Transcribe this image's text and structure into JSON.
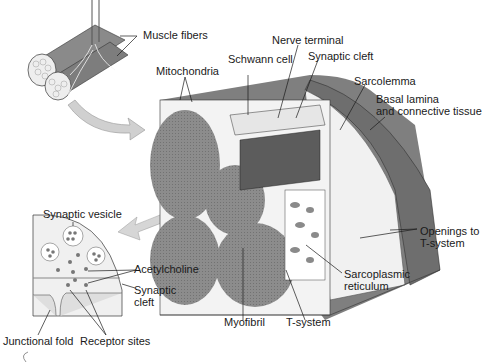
{
  "figure": {
    "colors": {
      "background": "#ffffff",
      "muscle_gray": "#8f8f8f",
      "dark_gray": "#6e6e6e",
      "light_gray": "#d9d9d9",
      "cytoplasm": "#f2f2f2",
      "arrow_fill": "#cfcfcf",
      "line": "#1a1a1a"
    }
  },
  "labels": {
    "muscle_fibers": "Muscle fibers",
    "mitochondria": "Mitochondria",
    "schwann_cell": "Schwann cell",
    "nerve_terminal": "Nerve terminal",
    "synaptic_cleft_top": "Synaptic cleft",
    "sarcolemma": "Sarcolemma",
    "basal_lamina_1": "Basal lamina",
    "basal_lamina_2": "and connective tissue",
    "synaptic_vesicle": "Synaptic vesicle",
    "acetylcholine": "Acetylcholine",
    "synaptic_cleft_inset_1": "Synaptic",
    "synaptic_cleft_inset_2": "cleft",
    "junctional_fold": "Junctional fold",
    "receptor_sites": "Receptor sites",
    "openings_1": "Openings to",
    "openings_2": "T-system",
    "sarcoplasmic_1": "Sarcoplasmic",
    "sarcoplasmic_2": "reticulum",
    "myofibril": "Myofibril",
    "t_system": "T-system"
  }
}
